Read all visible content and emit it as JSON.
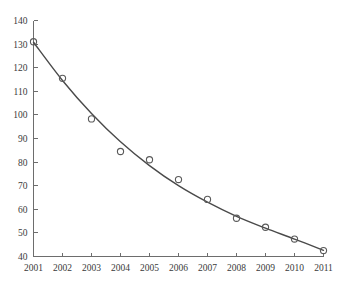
{
  "chart_data": {
    "type": "scatter",
    "title": "",
    "subtitle": "",
    "xlabel": "",
    "ylabel": "",
    "categories": [
      "2001",
      "2002",
      "2003",
      "2004",
      "2005",
      "2006",
      "2007",
      "2008",
      "2009",
      "2010",
      "2011"
    ],
    "x": [
      2001,
      2002,
      2003,
      2004,
      2005,
      2006,
      2007,
      2008,
      2009,
      2010,
      2011
    ],
    "values": [
      131.0,
      115.5,
      98.3,
      84.5,
      81.0,
      72.6,
      64.2,
      56.2,
      52.4,
      47.4,
      42.5
    ],
    "series": [
      {
        "name": "observed",
        "type": "scatter",
        "marker": "open-circle",
        "values": [
          131.0,
          115.5,
          98.3,
          84.5,
          81.0,
          72.6,
          64.2,
          56.2,
          52.4,
          47.4,
          42.5
        ]
      },
      {
        "name": "fitted-curve",
        "type": "line",
        "values": [
          130.8,
          114.6,
          100.6,
          88.6,
          78.5,
          70.0,
          63.0,
          57.0,
          52.0,
          47.4,
          42.6
        ]
      }
    ],
    "xlim": [
      2001,
      2011
    ],
    "ylim": [
      40,
      140
    ],
    "yticks": [
      40,
      50,
      60,
      70,
      80,
      90,
      100,
      110,
      120,
      130,
      140
    ],
    "ytick_labels": [
      "40",
      "50",
      "60",
      "70",
      "80",
      "90",
      "100",
      "110",
      "120",
      "130",
      "140"
    ],
    "xticks": [
      2001,
      2002,
      2003,
      2004,
      2005,
      2006,
      2007,
      2008,
      2009,
      2010,
      2011
    ],
    "xtick_labels": [
      "2001",
      "2002",
      "2003",
      "2004",
      "2005",
      "2006",
      "2007",
      "2008",
      "2009",
      "2010",
      "2011"
    ],
    "grid": false,
    "legend": null,
    "legend_position": "none",
    "annotations": [],
    "colors": {
      "background": "#ffffff",
      "axis": "#6d6d6d",
      "curve": "#4a4a4a",
      "marker": "#5a5a5a",
      "tick_text": "#3a3a3a"
    }
  }
}
